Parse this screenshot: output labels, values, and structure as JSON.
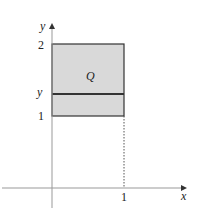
{
  "diagram": {
    "axes": {
      "x_label": "x",
      "y_label": "y",
      "x_tick": "1",
      "y_ticks": [
        "2",
        "1"
      ],
      "y_var_label": "y"
    },
    "region": {
      "label": "Q",
      "fill": "#d9d9d9",
      "stroke": "#333333",
      "x_range": [
        0,
        1
      ],
      "y_range": [
        1,
        2
      ]
    },
    "dotted_line": "x = 1 from y = 0 to y = 1"
  }
}
